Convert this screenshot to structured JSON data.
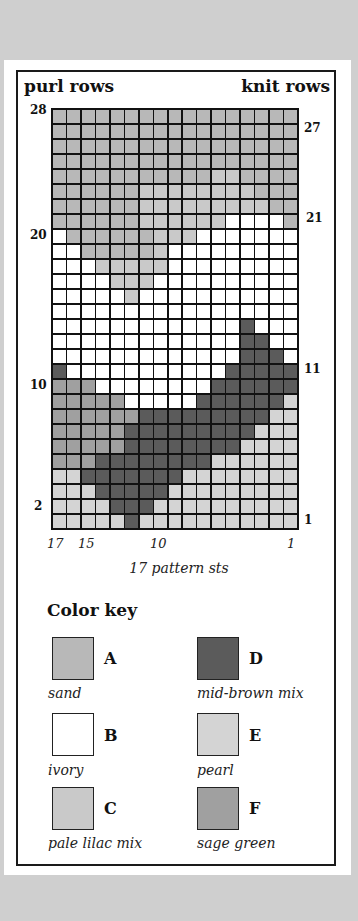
{
  "header": {
    "left": "purl rows",
    "right": "knit rows"
  },
  "chart_data": {
    "type": "heatmap",
    "title": "",
    "xlabel": "17 pattern sts",
    "ylabel_left": "purl rows",
    "ylabel_right": "knit rows",
    "columns": 17,
    "rows": 28,
    "x_tick_labels": [
      "17",
      "15",
      "10",
      "1"
    ],
    "left_row_labels": [
      "28",
      "20",
      "10",
      "2"
    ],
    "right_row_labels": [
      "27",
      "21",
      "11",
      "1"
    ],
    "legend": [
      {
        "key": "A",
        "name": "sand",
        "color": "#b8b8b8"
      },
      {
        "key": "B",
        "name": "ivory",
        "color": "#ffffff"
      },
      {
        "key": "C",
        "name": "pale lilac mix",
        "color": "#c9c9c9"
      },
      {
        "key": "D",
        "name": "mid-brown mix",
        "color": "#5b5b5b"
      },
      {
        "key": "E",
        "name": "pearl",
        "color": "#d4d4d4"
      },
      {
        "key": "F",
        "name": "sage green",
        "color": "#a0a0a0"
      }
    ],
    "grid_top_to_bottom": [
      "AAAAAAAAAAAAAAAAA",
      "AAAAAAAAAAAAAAAAA",
      "AAAAAAAAAAAAAAAAA",
      "AAAAAAAAAAAAAAAAA",
      "AAAAAAAAAAACCAAAA",
      "AAAAAACCCCCCCCAAA",
      "AAAAAACCCCCCCCCAA",
      "AAAAAACCCCCCBBBBA",
      "BAAAAAACCCBBBBBBB",
      "BBAAAAACBBBBBBBBB",
      "BBBCCCCCBBBBBBBBB",
      "BBBBCCCBBBBBBBBBB",
      "BBBBBCBBBBBBBBBBB",
      "BBBBBBBBBBBBBBBBB",
      "BBBBBBBBBBBBBDBBB",
      "BBBBBBBBBBBBBDDBB",
      "BBBBBBBBBBBBBDDDB",
      "DBBBBBBBBBBBDDDDD",
      "FFFBBBBBBBBDDDDDD",
      "FFFFFBBBBBDDDDDDE",
      "FFFFFFDDDDDDDDDEE",
      "FFFFFDDDDDDDDDEEE",
      "FFFFFDDDDDDDDEEEE",
      "FFFDDDDDDDDEEEEEE",
      "EEDDDDDDDEEEEEEEE",
      "EEEDDDDDEEEEEEEEE",
      "EEEEDDDEEEEEEEEEE",
      "EEEEEDEEEEEEEEEEE"
    ]
  },
  "color_key": {
    "title": "Color key",
    "items": [
      {
        "letter": "A",
        "name": "sand"
      },
      {
        "letter": "B",
        "name": "ivory"
      },
      {
        "letter": "C",
        "name": "pale lilac mix"
      },
      {
        "letter": "D",
        "name": "mid-brown mix"
      },
      {
        "letter": "E",
        "name": "pearl"
      },
      {
        "letter": "F",
        "name": "sage green"
      }
    ]
  }
}
